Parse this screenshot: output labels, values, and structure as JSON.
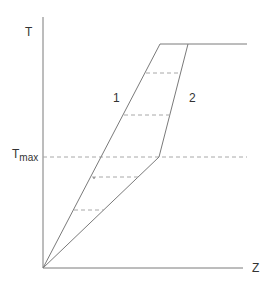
{
  "diagram": {
    "y_axis_label": "T",
    "x_axis_label": "Z",
    "tmax_label_main": "T",
    "tmax_label_sub": "max",
    "curve1_label": "1",
    "curve2_label": "2",
    "colors": {
      "line": "#7a7a7a",
      "dashed": "#a8a8a8",
      "text": "#333333"
    }
  }
}
